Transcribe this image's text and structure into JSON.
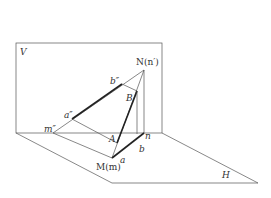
{
  "diagram": {
    "planes": {
      "vertical_label": "V",
      "horizontal_label": "H"
    },
    "points": {
      "N": "N(n′)",
      "b2": "b″",
      "B": "B",
      "a2": "a″",
      "m2": "m″",
      "A": "A",
      "n": "n",
      "b": "b",
      "M": "M(m)",
      "a": "a"
    }
  }
}
